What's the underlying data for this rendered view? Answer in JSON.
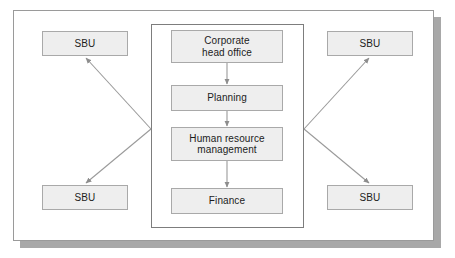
{
  "diagram": {
    "outer_frame": {
      "name": "organisation-boundary"
    },
    "inner_frame": {
      "name": "corporate-centre-boundary"
    },
    "centre_nodes": [
      {
        "id": "corporate",
        "label": "Corporate\nhead office"
      },
      {
        "id": "planning",
        "label": "Planning"
      },
      {
        "id": "hrm",
        "label": "Human resource\nmanagement"
      },
      {
        "id": "finance",
        "label": "Finance"
      }
    ],
    "sbu_nodes": [
      {
        "id": "sbu-tl",
        "label": "SBU",
        "position": "top-left"
      },
      {
        "id": "sbu-bl",
        "label": "SBU",
        "position": "bottom-left"
      },
      {
        "id": "sbu-tr",
        "label": "SBU",
        "position": "top-right"
      },
      {
        "id": "sbu-br",
        "label": "SBU",
        "position": "bottom-right"
      }
    ],
    "connectors": [
      {
        "id": "corporate-to-planning",
        "from": "corporate",
        "to": "planning",
        "style": "vertical-arrow"
      },
      {
        "id": "planning-to-hrm",
        "from": "planning",
        "to": "hrm",
        "style": "vertical-arrow"
      },
      {
        "id": "hrm-to-finance",
        "from": "hrm",
        "to": "finance",
        "style": "vertical-arrow"
      },
      {
        "id": "centre-to-sbu-tl",
        "from": "corporate-centre",
        "to": "sbu-tl",
        "style": "diagonal-arrow"
      },
      {
        "id": "centre-to-sbu-bl",
        "from": "corporate-centre",
        "to": "sbu-bl",
        "style": "diagonal-arrow"
      },
      {
        "id": "centre-to-sbu-tr",
        "from": "corporate-centre",
        "to": "sbu-tr",
        "style": "diagonal-arrow"
      },
      {
        "id": "centre-to-sbu-br",
        "from": "corporate-centre",
        "to": "sbu-br",
        "style": "diagonal-arrow"
      }
    ],
    "colors": {
      "node_fill": "#eeeeee",
      "node_border": "#a9a9a9",
      "frame_border": "#9a9a9a",
      "inner_frame_border": "#7d7d7d",
      "connector": "#8d8d8d",
      "shadow": "#a8a8a8",
      "text": "#1c1c1c",
      "background": "#ffffff"
    }
  }
}
